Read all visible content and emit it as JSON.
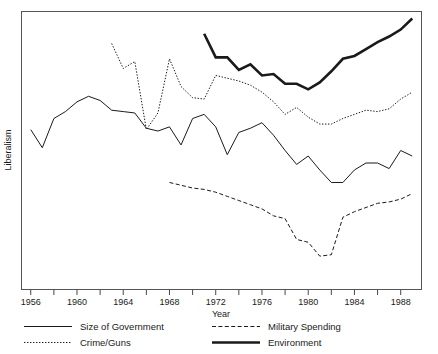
{
  "chart_data": {
    "type": "line",
    "title": "",
    "xlabel": "Year",
    "ylabel": "Liberalism",
    "xlim": [
      1955.2,
      1989.8
    ],
    "ylim": [
      0,
      100
    ],
    "grid": false,
    "legend_position": "below-axes",
    "x_tick_labels": [
      "1956",
      "1960",
      "1964",
      "1968",
      "1972",
      "1976",
      "1980",
      "1984",
      "1988"
    ],
    "x_major_ticks": [
      1956,
      1960,
      1964,
      1968,
      1972,
      1976,
      1980,
      1984,
      1988
    ],
    "x_minor_ticks": [
      1958,
      1962,
      1966,
      1970,
      1974,
      1978,
      1982,
      1986
    ],
    "y_tick_labels": [],
    "series": [
      {
        "name": "Size of Government",
        "style": "solid",
        "width": "thin",
        "x": [
          1956,
          1957,
          1958,
          1959,
          1960,
          1961,
          1962,
          1963,
          1964,
          1965,
          1966,
          1967,
          1968,
          1969,
          1970,
          1971,
          1972,
          1973,
          1974,
          1975,
          1976,
          1977,
          1978,
          1979,
          1980,
          1981,
          1982,
          1983,
          1984,
          1985,
          1986,
          1987,
          1988,
          1989
        ],
        "values": [
          57.5,
          51.0,
          61.5,
          64.0,
          67.5,
          69.5,
          68.0,
          64.5,
          64.0,
          63.5,
          58.0,
          57.0,
          58.5,
          52.0,
          61.5,
          63.0,
          58.5,
          48.5,
          56.5,
          58.0,
          60.0,
          55.5,
          50.0,
          45.0,
          48.0,
          43.0,
          38.5,
          38.5,
          43.0,
          45.5,
          45.5,
          43.5,
          50.0,
          48.0
        ]
      },
      {
        "name": "Crime/Guns",
        "style": "dotted",
        "width": "thin",
        "x": [
          1963,
          1964,
          1965,
          1966,
          1967,
          1968,
          1969,
          1970,
          1971,
          1972,
          1973,
          1974,
          1975,
          1976,
          1977,
          1978,
          1979,
          1980,
          1981,
          1982,
          1983,
          1984,
          1985,
          1986,
          1987,
          1988,
          1989
        ],
        "values": [
          88.5,
          79.5,
          82.0,
          57.5,
          63.5,
          83.0,
          73.0,
          69.0,
          68.5,
          77.0,
          76.0,
          75.0,
          73.5,
          71.0,
          67.5,
          63.0,
          65.5,
          62.0,
          59.5,
          59.5,
          61.5,
          63.0,
          64.5,
          64.0,
          65.0,
          68.5,
          71.0
        ]
      },
      {
        "name": "Military Spending",
        "style": "dashed",
        "width": "thin",
        "x": [
          1968,
          1969,
          1970,
          1971,
          1972,
          1973,
          1974,
          1975,
          1976,
          1977,
          1978,
          1979,
          1980,
          1981,
          1982,
          1983,
          1984,
          1985,
          1986,
          1987,
          1988,
          1989
        ],
        "values": [
          38.5,
          37.5,
          36.5,
          36.0,
          35.0,
          33.5,
          32.0,
          30.5,
          29.0,
          26.5,
          25.5,
          18.0,
          17.0,
          12.0,
          12.5,
          26.0,
          28.0,
          29.5,
          31.0,
          31.5,
          32.5,
          34.5
        ]
      },
      {
        "name": "Environment",
        "style": "solid",
        "width": "thick",
        "x": [
          1971,
          1972,
          1973,
          1974,
          1975,
          1976,
          1977,
          1978,
          1979,
          1980,
          1981,
          1982,
          1983,
          1984,
          1985,
          1986,
          1987,
          1988,
          1989
        ],
        "values": [
          92.0,
          83.5,
          83.5,
          79.0,
          81.0,
          77.0,
          77.5,
          74.0,
          74.0,
          72.0,
          74.5,
          78.5,
          83.0,
          84.0,
          86.5,
          89.0,
          91.0,
          93.5,
          97.5
        ]
      }
    ],
    "legend_entries": [
      {
        "label": "Size of Government",
        "style": "solid",
        "width": "thin"
      },
      {
        "label": "Military Spending",
        "style": "dashed",
        "width": "thin"
      },
      {
        "label": "Crime/Guns",
        "style": "dotted",
        "width": "thin"
      },
      {
        "label": "Environment",
        "style": "solid",
        "width": "thick"
      }
    ]
  }
}
